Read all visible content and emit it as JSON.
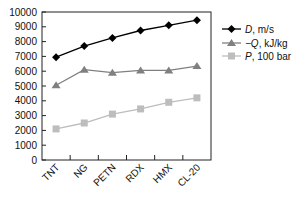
{
  "chart_data": {
    "type": "line",
    "title": "",
    "xlabel": "",
    "ylabel": "",
    "categories": [
      "TNT",
      "NG",
      "PETN",
      "RDX",
      "HMX",
      "CL-20"
    ],
    "ylim": [
      0,
      10000
    ],
    "yticks": [
      0,
      1000,
      2000,
      3000,
      4000,
      5000,
      6000,
      7000,
      8000,
      9000,
      10000
    ],
    "grid": false,
    "legend_position": "right",
    "series": [
      {
        "name": "D, m/s",
        "name_italic": "D",
        "name_rest": ", m/s",
        "marker": "diamond",
        "color": "#000000",
        "values": [
          6950,
          7700,
          8250,
          8750,
          9100,
          9450
        ]
      },
      {
        "name": "−Q, kJ/kg",
        "name_italic": "−Q",
        "name_rest": ", kJ/kg",
        "marker": "triangle",
        "color": "#808080",
        "values": [
          5050,
          6100,
          5900,
          6050,
          6050,
          6350
        ]
      },
      {
        "name": "P, 100 bar",
        "name_italic": "P",
        "name_rest": ", 100 bar",
        "marker": "square",
        "color": "#bdbdbd",
        "values": [
          2100,
          2500,
          3100,
          3450,
          3900,
          4200
        ]
      }
    ]
  }
}
